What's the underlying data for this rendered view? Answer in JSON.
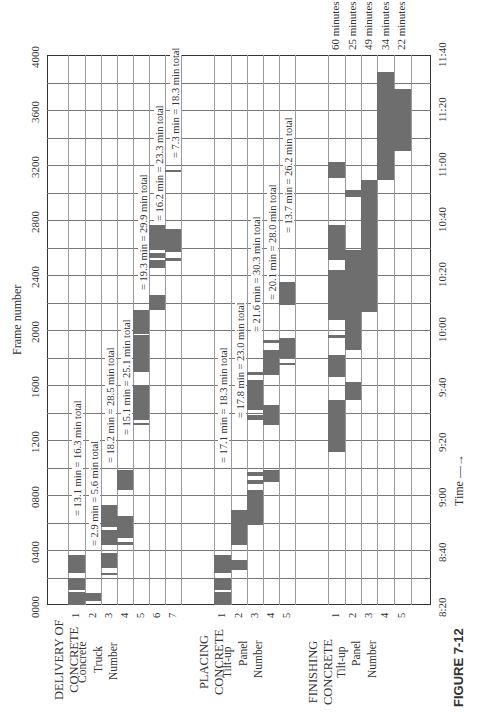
{
  "chart_data": {
    "type": "gantt",
    "orientation": "rotated 90deg counter-clockwise (read with page turned)",
    "title": "",
    "caption": "FIGURE 7-12",
    "frame_axis": {
      "label": "Frame number",
      "ticks": [
        "0000",
        "0400",
        "0800",
        "1200",
        "1600",
        "2000",
        "2400",
        "2800",
        "3200",
        "3600",
        "4000"
      ],
      "range": [
        0,
        4000
      ]
    },
    "time_axis": {
      "label": "Time",
      "ticks": [
        "8:20",
        "8:40",
        "9:00",
        "9:20",
        "9:40",
        "10:00",
        "10:20",
        "10:40",
        "11:00",
        "11:20",
        "11:40"
      ],
      "range": [
        "8:20",
        "11:40"
      ]
    },
    "groups": [
      {
        "name": "DELIVERY OF CONCRETE",
        "sublabels": [
          "Concrete",
          "Truck",
          "Number"
        ],
        "rows": [
          {
            "num": "1",
            "annotation": "= 13.1 min = 16.3 min total"
          },
          {
            "num": "2",
            "annotation": "= 2.9 min = 5.6 min total"
          },
          {
            "num": "3",
            "annotation": "= 18.2 min = 28.5 min total"
          },
          {
            "num": "4",
            "annotation": "= 15.1 min = 25.1 min total"
          },
          {
            "num": "5",
            "annotation": "= 19.3 min = 29.9 min total"
          },
          {
            "num": "6",
            "annotation": "= 16.2 min = 23.3 min total"
          },
          {
            "num": "7",
            "annotation": "= 7.3 min = 18.3 min total"
          }
        ]
      },
      {
        "name": "PLACING CONCRETE",
        "sublabels": [
          "Tilt-up",
          "Panel",
          "Number"
        ],
        "rows": [
          {
            "num": "1",
            "annotation": "= 17.1 min = 18.3 min total"
          },
          {
            "num": "2",
            "annotation": "= 17.8 min = 23.0 min total"
          },
          {
            "num": "3",
            "annotation": "= 21.6 min = 30.3 min total"
          },
          {
            "num": "4",
            "annotation": "= 20.1 min = 28.0 min total"
          },
          {
            "num": "5",
            "annotation": "= 13.7 min = 26.2 min total"
          }
        ]
      },
      {
        "name": "FINISHING CONCRETE",
        "sublabels": [
          "Tilt-up",
          "Panel",
          "Number"
        ],
        "rows": [
          {
            "num": "1",
            "annotation": "60 minutes"
          },
          {
            "num": "2",
            "annotation": "25 minutes"
          },
          {
            "num": "3",
            "annotation": "49 minutes"
          },
          {
            "num": "4",
            "annotation": "34 minutes"
          },
          {
            "num": "5",
            "annotation": "22 minutes"
          }
        ]
      }
    ],
    "grid": true,
    "bar_color": "#6e6e6e"
  },
  "labels": {
    "frame_axis_title": "Frame number",
    "time_axis_title": "Time",
    "time_arrow": "—→",
    "figure_caption": "FIGURE 7-12",
    "delivery_1": "DELIVERY OF",
    "delivery_2": "CONCRETE",
    "placing_1": "PLACING",
    "placing_2": "CONCRETE",
    "finishing_1": "FINISHING",
    "finishing_2": "CONCRETE",
    "sub_1": "Concrete",
    "sub_2": "Truck",
    "sub_3": "Number",
    "psub_1": "Tilt-up",
    "psub_2": "Panel",
    "psub_3": "Number"
  }
}
